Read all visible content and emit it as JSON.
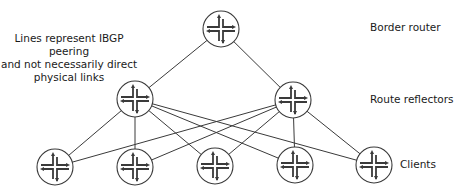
{
  "diagram": {
    "note_lines": [
      "Lines represent IBGP peering",
      "and not necessarily direct",
      "physical links"
    ],
    "tiers": {
      "border": {
        "label": "Border router"
      },
      "reflectors": {
        "label": "Route reflectors"
      },
      "clients": {
        "label": "Clients"
      }
    },
    "nodes": [
      {
        "id": "border",
        "tier": "border",
        "x": 221,
        "y": 29
      },
      {
        "id": "rr1",
        "tier": "reflectors",
        "x": 135,
        "y": 99
      },
      {
        "id": "rr2",
        "tier": "reflectors",
        "x": 293,
        "y": 100
      },
      {
        "id": "c1",
        "tier": "clients",
        "x": 55,
        "y": 167
      },
      {
        "id": "c2",
        "tier": "clients",
        "x": 135,
        "y": 167
      },
      {
        "id": "c3",
        "tier": "clients",
        "x": 215,
        "y": 166
      },
      {
        "id": "c4",
        "tier": "clients",
        "x": 295,
        "y": 165
      },
      {
        "id": "c5",
        "tier": "clients",
        "x": 374,
        "y": 165
      }
    ],
    "edges": [
      [
        "border",
        "rr1"
      ],
      [
        "border",
        "rr2"
      ],
      [
        "rr1",
        "c1"
      ],
      [
        "rr1",
        "c2"
      ],
      [
        "rr1",
        "c3"
      ],
      [
        "rr1",
        "c4"
      ],
      [
        "rr1",
        "c5"
      ],
      [
        "rr2",
        "c1"
      ],
      [
        "rr2",
        "c2"
      ],
      [
        "rr2",
        "c3"
      ],
      [
        "rr2",
        "c4"
      ],
      [
        "rr2",
        "c5"
      ]
    ],
    "icon": "router-icon",
    "colors": {
      "line": "#3a3a3a",
      "node_stroke": "#3a3a3a",
      "node_fill": "#ffffff",
      "text": "#1a1a1a"
    }
  }
}
